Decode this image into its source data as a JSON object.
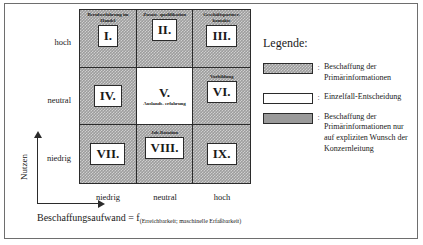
{
  "figure": {
    "axes": {
      "y_title": "Nutzen",
      "y_ticks": [
        "hoch",
        "neutral",
        "niedrig"
      ],
      "x_ticks": [
        "niedrig",
        "neutral",
        "hoch"
      ],
      "x_title_main": "Beschaffungsaufwand = f",
      "x_title_sub": "(Erreichbarkeit; maschinelle Erfaßbarkeit)"
    },
    "matrix": {
      "cells": [
        {
          "roman": "I.",
          "caption": "Berufserfahrung im Handel",
          "caption_pos": "above",
          "fill": "hatch"
        },
        {
          "roman": "II.",
          "caption": "Zusatz- qualifikation",
          "caption_pos": "above",
          "fill": "hatch"
        },
        {
          "roman": "III.",
          "caption": "Geschäftspartner- kontakte",
          "caption_pos": "above",
          "fill": "hatch"
        },
        {
          "roman": "IV.",
          "caption": "",
          "caption_pos": "none",
          "fill": "hatch"
        },
        {
          "roman": "V.",
          "caption": "Auslands- erfahrung",
          "caption_pos": "below",
          "fill": "none"
        },
        {
          "roman": "VI.",
          "caption": "Vorbildung",
          "caption_pos": "above",
          "fill": "hatch"
        },
        {
          "roman": "VII.",
          "caption": "",
          "caption_pos": "none",
          "fill": "hatch"
        },
        {
          "roman": "VIII.",
          "caption": "Job-Rotation",
          "caption_pos": "above",
          "fill": "hatch"
        },
        {
          "roman": "IX.",
          "caption": "",
          "caption_pos": "none",
          "fill": "hatch"
        }
      ]
    },
    "legend": {
      "title": "Legende:",
      "separator": ":",
      "entries": [
        {
          "swatch": "hatch",
          "text": "Beschaffung der Primärinformationen"
        },
        {
          "swatch": "white",
          "text": "Einzelfall-Entscheidung"
        },
        {
          "swatch": "solid",
          "text": "Beschaffung der Primärinformationen nur auf expliziten Wunsch der Konzernleitung"
        }
      ]
    },
    "colors": {
      "hatch_gray": "#9d9d9d",
      "solid_gray": "#9a9a9a",
      "line": "#2b2b2b",
      "frame": "#6e6e6e"
    }
  }
}
